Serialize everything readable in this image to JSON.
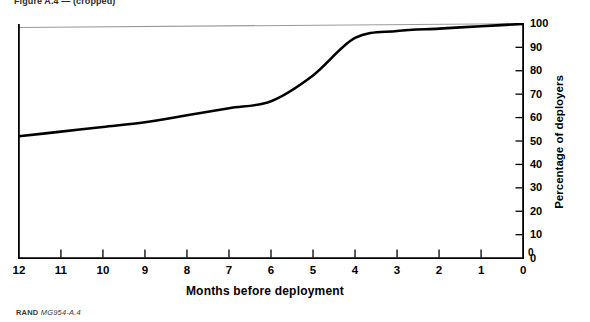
{
  "figure": {
    "id_prefix": "RAND",
    "id_number": "MG954-A.4",
    "cropped_header": "Figure A.4 — (cropped)"
  },
  "chart_data": {
    "type": "line",
    "title": "",
    "xlabel": "Months before deployment",
    "ylabel": "Percentage of deployers",
    "xlim": [
      12,
      0
    ],
    "ylim": [
      0,
      100
    ],
    "x_axis_reversed": true,
    "grid": false,
    "legend": "none",
    "x_tick_labels": [
      "12",
      "11",
      "10",
      "9",
      "8",
      "7",
      "6",
      "5",
      "4",
      "3",
      "2",
      "1",
      "0"
    ],
    "y_tick_labels": [
      "0",
      "10",
      "20",
      "30",
      "40",
      "50",
      "60",
      "70",
      "80",
      "90",
      "100"
    ],
    "y_axis_position": "right",
    "x_axis_zero_label": "0",
    "series": [
      {
        "name": "Cumulative percentage of deployers notified",
        "x": [
          12,
          11,
          10,
          9,
          8,
          7,
          6,
          5,
          4,
          3,
          2,
          1,
          0
        ],
        "values": [
          52,
          54,
          56,
          58,
          61,
          64,
          67,
          78,
          94,
          97,
          98,
          99,
          100
        ],
        "color": "#000000"
      }
    ]
  },
  "colors": {
    "line": "#000000",
    "axis": "#000000",
    "background": "#ffffff",
    "artifact_line": "#9a9a9a"
  }
}
